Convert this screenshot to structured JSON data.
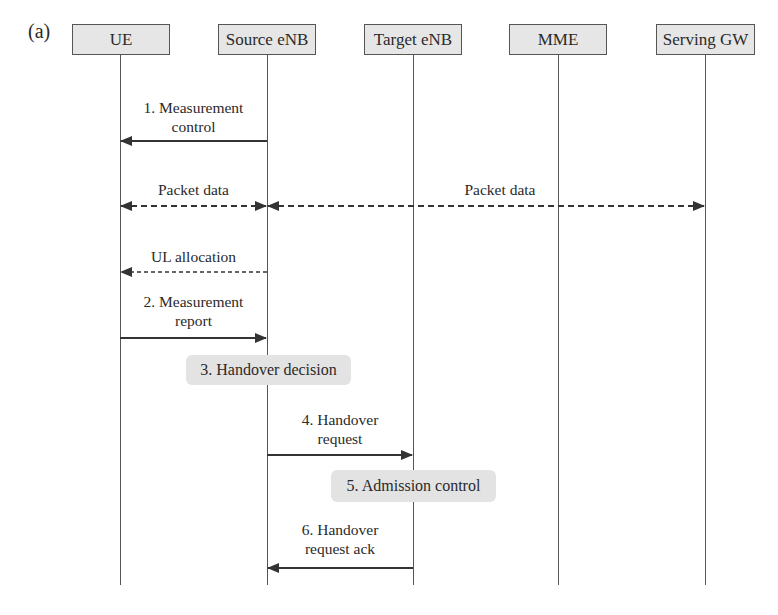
{
  "figure": {
    "panel_label": "(a)",
    "entities": [
      {
        "id": "ue",
        "label": "UE",
        "x": 120
      },
      {
        "id": "source_enb",
        "label": "Source eNB",
        "x": 267
      },
      {
        "id": "target_enb",
        "label": "Target eNB",
        "x": 413
      },
      {
        "id": "mme",
        "label": "MME",
        "x": 558
      },
      {
        "id": "serving_gw",
        "label": "Serving GW",
        "x": 705
      }
    ],
    "messages": [
      {
        "id": "m1",
        "label": "1. Measurement\ncontrol",
        "from": "Source eNB",
        "to": "UE",
        "style": "solid"
      },
      {
        "id": "m_pd1",
        "label": "Packet data",
        "from": "Source eNB",
        "to": "UE",
        "style": "dashed",
        "bidirectional": true
      },
      {
        "id": "m_pd2",
        "label": "Packet data",
        "from": "Source eNB",
        "to": "Serving GW",
        "style": "dashed",
        "bidirectional": true
      },
      {
        "id": "m_ul",
        "label": "UL allocation",
        "from": "Source eNB",
        "to": "UE",
        "style": "dashed"
      },
      {
        "id": "m2",
        "label": "2. Measurement\nreport",
        "from": "UE",
        "to": "Source eNB",
        "style": "solid"
      },
      {
        "id": "m4",
        "label": "4. Handover\nrequest",
        "from": "Source eNB",
        "to": "Target eNB",
        "style": "solid"
      },
      {
        "id": "m6",
        "label": "6. Handover\nrequest ack",
        "from": "Target eNB",
        "to": "Source eNB",
        "style": "solid"
      }
    ],
    "actions": [
      {
        "id": "a3",
        "label": "3. Handover decision",
        "at": "Source eNB"
      },
      {
        "id": "a5",
        "label": "5. Admission control",
        "at": "Target eNB"
      }
    ]
  },
  "labels": {
    "panel": "(a)",
    "e_ue": "UE",
    "e_source": "Source eNB",
    "e_target": "Target eNB",
    "e_mme": "MME",
    "e_sgw": "Serving GW",
    "m1_line1": "1. Measurement",
    "m1_line2": "control",
    "pd_left": "Packet data",
    "pd_right": "Packet data",
    "ul": "UL allocation",
    "m2_line1": "2. Measurement",
    "m2_line2": "report",
    "a3": "3. Handover decision",
    "m4_line1": "4. Handover",
    "m4_line2": "request",
    "a5": "5. Admission control",
    "m6_line1": "6. Handover",
    "m6_line2": "request ack"
  },
  "colors": {
    "line": "#333333",
    "box_fill": "#e6e6e6",
    "action_fill": "#e3e3e3"
  }
}
